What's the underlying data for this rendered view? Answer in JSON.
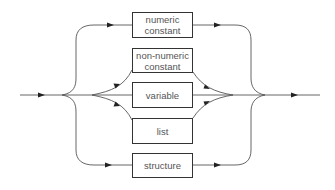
{
  "diagram": {
    "type": "syntax-railroad",
    "boxes": [
      {
        "id": "numeric-constant",
        "label": "numeric\nconstant"
      },
      {
        "id": "non-numeric-constant",
        "label": "non-numeric\nconstant"
      },
      {
        "id": "variable",
        "label": "variable"
      },
      {
        "id": "list",
        "label": "list"
      },
      {
        "id": "structure",
        "label": "structure"
      }
    ],
    "colors": {
      "line": "#555555",
      "arrow": "#222222",
      "box_border": "#333333",
      "text": "#555555"
    }
  }
}
